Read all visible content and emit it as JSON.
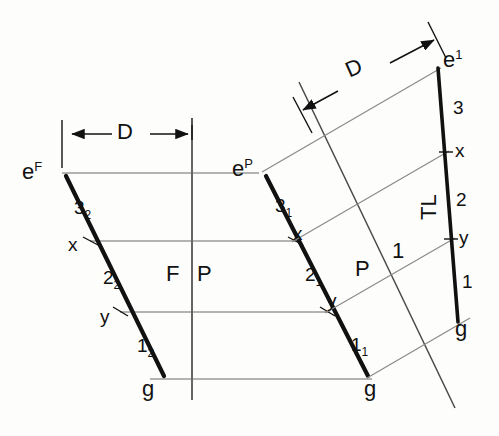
{
  "drawing": {
    "title": "Descriptive geometry: true length of line e-g by auxiliary view",
    "background_color": "#fdfdfc",
    "ink_color": "#111111",
    "thin_line_color": "#4a4a4a",
    "views": [
      {
        "id": "frontal",
        "name": "F",
        "line_endpoints": {
          "start_label": "e",
          "start_superscript": "F",
          "end_label": "g"
        },
        "segment_labels": [
          {
            "text": "3",
            "subscript": "2"
          },
          {
            "text": "2",
            "subscript": "2"
          },
          {
            "text": "1",
            "subscript": "2"
          }
        ],
        "point_labels": [
          "x",
          "y"
        ]
      },
      {
        "id": "profile",
        "name": "P",
        "line_endpoints": {
          "start_label": "e",
          "start_superscript": "P",
          "end_label": "g"
        },
        "segment_labels": [
          {
            "text": "3",
            "subscript": "1"
          },
          {
            "text": "2",
            "subscript": "1"
          },
          {
            "text": "1",
            "subscript": "1"
          }
        ],
        "point_labels": [
          "x",
          "y"
        ]
      },
      {
        "id": "auxiliary",
        "name": "1",
        "line_endpoints": {
          "start_label": "e",
          "start_superscript": "1",
          "end_label": "g"
        },
        "segment_labels": [
          {
            "text": "3",
            "subscript": ""
          },
          {
            "text": "2",
            "subscript": ""
          },
          {
            "text": "1",
            "subscript": ""
          }
        ],
        "point_labels": [
          "x",
          "y"
        ],
        "annotation": "TL"
      }
    ],
    "fold_lines": [
      {
        "id": "fp",
        "left_label": "F",
        "right_label": "P",
        "orientation": "vertical"
      },
      {
        "id": "p1",
        "left_label": "P",
        "right_label": "1",
        "orientation": "inclined"
      }
    ],
    "dimensions": [
      {
        "id": "d-left",
        "label": "D",
        "orientation": "horizontal"
      },
      {
        "id": "d-right",
        "label": "D",
        "orientation": "inclined"
      }
    ]
  },
  "labels": {
    "e_letter": "e",
    "g_letter": "g",
    "x_letter": "x",
    "y_letter": "y",
    "sup_F": "F",
    "sup_P": "P",
    "sup_1": "1",
    "seg3_F": "3",
    "seg3_F_sub": "2",
    "seg2_F": "2",
    "seg2_F_sub": "2",
    "seg1_F": "1",
    "seg1_F_sub": "2",
    "seg3_P": "3",
    "seg3_P_sub": "1",
    "seg2_P": "2",
    "seg2_P_sub": "1",
    "seg1_P": "1",
    "seg1_P_sub": "1",
    "seg3_A": "3",
    "seg2_A": "2",
    "seg1_A": "1",
    "fold_F": "F",
    "fold_P_left": "P",
    "fold_P_right": "P",
    "fold_1": "1",
    "tl": "TL",
    "dim_D_left": "D",
    "dim_D_right": "D"
  }
}
